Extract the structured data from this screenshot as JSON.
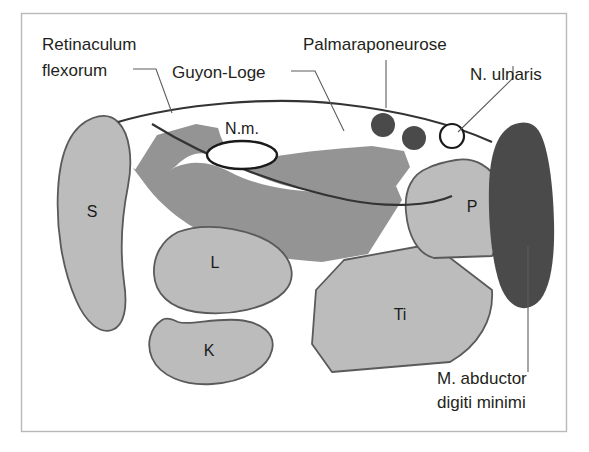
{
  "figure": {
    "frame": {
      "x": 21,
      "y": 13,
      "w": 546,
      "h": 419
    },
    "colors": {
      "light_gray": "#bcbcbc",
      "medium_gray": "#949494",
      "dark_gray": "#4a4a4a",
      "outline": "#333333",
      "organ_stroke": "#5a5a5a",
      "leader": "#5d5d5d",
      "text": "#231f20",
      "background": "#ffffff",
      "frame_border": "#b9b9b9"
    }
  },
  "labels": {
    "retinaculum_line1": "Retinaculum",
    "retinaculum_line2": "flexorum",
    "guyon_loge": "Guyon-Loge",
    "palmaraponeurose": "Palmaraponeurose",
    "n_ulnaris": "N. ulnaris",
    "abductor_line1": "M. abductor",
    "abductor_line2": "digiti minimi"
  },
  "structures": [
    {
      "key": "nm",
      "label": "N.m.",
      "name": "nervus-medianus-ellipse",
      "fill": "#ffffff"
    },
    {
      "key": "s",
      "label": "S",
      "name": "os-scaphoideum",
      "fill": "#bcbcbc"
    },
    {
      "key": "l",
      "label": "L",
      "name": "os-lunatum",
      "fill": "#bcbcbc"
    },
    {
      "key": "k",
      "label": "K",
      "name": "os-capitatum",
      "fill": "#bcbcbc"
    },
    {
      "key": "ti",
      "label": "Ti",
      "name": "os-triquetrum",
      "fill": "#bcbcbc"
    },
    {
      "key": "p",
      "label": "P",
      "name": "os-pisiforme",
      "fill": "#bcbcbc"
    }
  ],
  "vessels": [
    {
      "name": "flexor-tendon-dot-1",
      "fill": "#4a4a4a",
      "cx": 383,
      "cy": 125,
      "r": 12
    },
    {
      "name": "flexor-tendon-dot-2",
      "fill": "#4a4a4a",
      "cx": 414,
      "cy": 138,
      "r": 12
    },
    {
      "name": "n-ulnaris-circle",
      "fill": "#ffffff",
      "cx": 452,
      "cy": 136,
      "r": 12
    }
  ],
  "muscle": {
    "name": "m-abductor-digiti-minimi",
    "fill": "#4a4a4a"
  }
}
